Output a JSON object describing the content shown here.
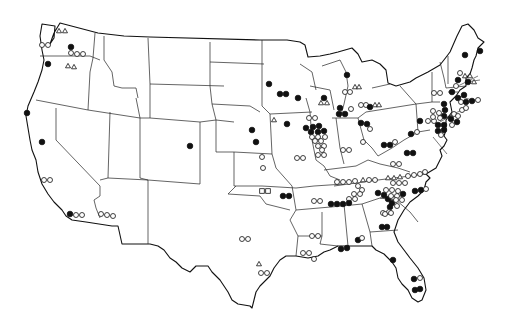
{
  "map": {
    "type": "point-symbol map",
    "region": "Contiguous United States",
    "colors": {
      "background": "#ffffff",
      "ink": "#111111"
    },
    "symbol_types": [
      "filled-circle",
      "open-circle",
      "open-triangle",
      "open-square"
    ],
    "markers": [
      {
        "x": 59,
        "y": 31,
        "t": "tri"
      },
      {
        "x": 65,
        "y": 31,
        "t": "tri"
      },
      {
        "x": 42,
        "y": 45,
        "t": "open"
      },
      {
        "x": 48,
        "y": 45,
        "t": "open"
      },
      {
        "x": 71,
        "y": 47,
        "t": "fill"
      },
      {
        "x": 71,
        "y": 53,
        "t": "open"
      },
      {
        "x": 77,
        "y": 54,
        "t": "open"
      },
      {
        "x": 83,
        "y": 54,
        "t": "open"
      },
      {
        "x": 48,
        "y": 64,
        "t": "fill"
      },
      {
        "x": 68,
        "y": 66,
        "t": "tri"
      },
      {
        "x": 74,
        "y": 67,
        "t": "tri"
      },
      {
        "x": 27,
        "y": 113,
        "t": "fill"
      },
      {
        "x": 42,
        "y": 142,
        "t": "fill"
      },
      {
        "x": 44,
        "y": 180,
        "t": "open"
      },
      {
        "x": 50,
        "y": 180,
        "t": "open"
      },
      {
        "x": 70,
        "y": 214,
        "t": "fill"
      },
      {
        "x": 76,
        "y": 215,
        "t": "open"
      },
      {
        "x": 82,
        "y": 215,
        "t": "open"
      },
      {
        "x": 101,
        "y": 214,
        "t": "open"
      },
      {
        "x": 107,
        "y": 215,
        "t": "open"
      },
      {
        "x": 113,
        "y": 216,
        "t": "open"
      },
      {
        "x": 190,
        "y": 146,
        "t": "fill"
      },
      {
        "x": 252,
        "y": 130,
        "t": "fill"
      },
      {
        "x": 256,
        "y": 142,
        "t": "fill"
      },
      {
        "x": 269,
        "y": 84,
        "t": "fill"
      },
      {
        "x": 280,
        "y": 94,
        "t": "fill"
      },
      {
        "x": 286,
        "y": 94,
        "t": "fill"
      },
      {
        "x": 298,
        "y": 98,
        "t": "fill"
      },
      {
        "x": 274,
        "y": 120,
        "t": "tri"
      },
      {
        "x": 287,
        "y": 124,
        "t": "fill"
      },
      {
        "x": 262,
        "y": 157,
        "t": "open"
      },
      {
        "x": 297,
        "y": 158,
        "t": "open"
      },
      {
        "x": 303,
        "y": 158,
        "t": "open"
      },
      {
        "x": 263,
        "y": 168,
        "t": "open"
      },
      {
        "x": 262,
        "y": 191,
        "t": "sq"
      },
      {
        "x": 268,
        "y": 191,
        "t": "sq"
      },
      {
        "x": 283,
        "y": 196,
        "t": "fill"
      },
      {
        "x": 289,
        "y": 196,
        "t": "fill"
      },
      {
        "x": 324,
        "y": 98,
        "t": "fill"
      },
      {
        "x": 321,
        "y": 103,
        "t": "tri"
      },
      {
        "x": 327,
        "y": 103,
        "t": "tri"
      },
      {
        "x": 319,
        "y": 126,
        "t": "fill"
      },
      {
        "x": 313,
        "y": 127,
        "t": "fill"
      },
      {
        "x": 306,
        "y": 128,
        "t": "fill"
      },
      {
        "x": 311,
        "y": 132,
        "t": "fill"
      },
      {
        "x": 318,
        "y": 132,
        "t": "fill"
      },
      {
        "x": 324,
        "y": 131,
        "t": "fill"
      },
      {
        "x": 312,
        "y": 137,
        "t": "open"
      },
      {
        "x": 318,
        "y": 137,
        "t": "open"
      },
      {
        "x": 325,
        "y": 137,
        "t": "open"
      },
      {
        "x": 315,
        "y": 141,
        "t": "open"
      },
      {
        "x": 321,
        "y": 141,
        "t": "open"
      },
      {
        "x": 318,
        "y": 146,
        "t": "open"
      },
      {
        "x": 324,
        "y": 146,
        "t": "open"
      },
      {
        "x": 322,
        "y": 150,
        "t": "open"
      },
      {
        "x": 318,
        "y": 155,
        "t": "open"
      },
      {
        "x": 324,
        "y": 155,
        "t": "open"
      },
      {
        "x": 309,
        "y": 118,
        "t": "open"
      },
      {
        "x": 315,
        "y": 118,
        "t": "open"
      },
      {
        "x": 347,
        "y": 75,
        "t": "fill"
      },
      {
        "x": 345,
        "y": 92,
        "t": "open"
      },
      {
        "x": 350,
        "y": 92,
        "t": "open"
      },
      {
        "x": 355,
        "y": 87,
        "t": "tri"
      },
      {
        "x": 359,
        "y": 87,
        "t": "tri"
      },
      {
        "x": 340,
        "y": 108,
        "t": "fill"
      },
      {
        "x": 339,
        "y": 114,
        "t": "fill"
      },
      {
        "x": 345,
        "y": 114,
        "t": "fill"
      },
      {
        "x": 351,
        "y": 109,
        "t": "open"
      },
      {
        "x": 361,
        "y": 105,
        "t": "open"
      },
      {
        "x": 366,
        "y": 105,
        "t": "open"
      },
      {
        "x": 370,
        "y": 107,
        "t": "fill"
      },
      {
        "x": 375,
        "y": 105,
        "t": "tri"
      },
      {
        "x": 379,
        "y": 105,
        "t": "tri"
      },
      {
        "x": 343,
        "y": 150,
        "t": "open"
      },
      {
        "x": 349,
        "y": 150,
        "t": "open"
      },
      {
        "x": 363,
        "y": 142,
        "t": "open"
      },
      {
        "x": 361,
        "y": 123,
        "t": "fill"
      },
      {
        "x": 367,
        "y": 124,
        "t": "fill"
      },
      {
        "x": 370,
        "y": 129,
        "t": "open"
      },
      {
        "x": 393,
        "y": 164,
        "t": "open"
      },
      {
        "x": 399,
        "y": 164,
        "t": "open"
      },
      {
        "x": 407,
        "y": 153,
        "t": "fill"
      },
      {
        "x": 413,
        "y": 153,
        "t": "fill"
      },
      {
        "x": 420,
        "y": 121,
        "t": "fill"
      },
      {
        "x": 428,
        "y": 121,
        "t": "open"
      },
      {
        "x": 434,
        "y": 121,
        "t": "open"
      },
      {
        "x": 384,
        "y": 145,
        "t": "fill"
      },
      {
        "x": 390,
        "y": 145,
        "t": "fill"
      },
      {
        "x": 395,
        "y": 142,
        "t": "open"
      },
      {
        "x": 411,
        "y": 134,
        "t": "fill"
      },
      {
        "x": 417,
        "y": 132,
        "t": "open"
      },
      {
        "x": 337,
        "y": 182,
        "t": "open"
      },
      {
        "x": 343,
        "y": 182,
        "t": "open"
      },
      {
        "x": 349,
        "y": 182,
        "t": "open"
      },
      {
        "x": 355,
        "y": 181,
        "t": "open"
      },
      {
        "x": 363,
        "y": 180,
        "t": "tri"
      },
      {
        "x": 369,
        "y": 180,
        "t": "open"
      },
      {
        "x": 375,
        "y": 180,
        "t": "open"
      },
      {
        "x": 388,
        "y": 178,
        "t": "tri"
      },
      {
        "x": 394,
        "y": 178,
        "t": "tri"
      },
      {
        "x": 400,
        "y": 177,
        "t": "tri"
      },
      {
        "x": 393,
        "y": 183,
        "t": "open"
      },
      {
        "x": 399,
        "y": 183,
        "t": "open"
      },
      {
        "x": 405,
        "y": 183,
        "t": "open"
      },
      {
        "x": 408,
        "y": 176,
        "t": "open"
      },
      {
        "x": 414,
        "y": 175,
        "t": "open"
      },
      {
        "x": 420,
        "y": 174,
        "t": "open"
      },
      {
        "x": 425,
        "y": 172,
        "t": "open"
      },
      {
        "x": 358,
        "y": 186,
        "t": "open"
      },
      {
        "x": 362,
        "y": 190,
        "t": "open"
      },
      {
        "x": 354,
        "y": 194,
        "t": "open"
      },
      {
        "x": 360,
        "y": 194,
        "t": "open"
      },
      {
        "x": 349,
        "y": 199,
        "t": "open"
      },
      {
        "x": 355,
        "y": 199,
        "t": "open"
      },
      {
        "x": 378,
        "y": 193,
        "t": "fill"
      },
      {
        "x": 384,
        "y": 195,
        "t": "fill"
      },
      {
        "x": 388,
        "y": 199,
        "t": "fill"
      },
      {
        "x": 392,
        "y": 203,
        "t": "fill"
      },
      {
        "x": 386,
        "y": 190,
        "t": "open"
      },
      {
        "x": 392,
        "y": 190,
        "t": "open"
      },
      {
        "x": 398,
        "y": 191,
        "t": "open"
      },
      {
        "x": 391,
        "y": 196,
        "t": "open"
      },
      {
        "x": 397,
        "y": 196,
        "t": "open"
      },
      {
        "x": 403,
        "y": 194,
        "t": "fill"
      },
      {
        "x": 396,
        "y": 200,
        "t": "open"
      },
      {
        "x": 402,
        "y": 200,
        "t": "open"
      },
      {
        "x": 390,
        "y": 207,
        "t": "fill"
      },
      {
        "x": 397,
        "y": 206,
        "t": "open"
      },
      {
        "x": 383,
        "y": 213,
        "t": "open"
      },
      {
        "x": 389,
        "y": 212,
        "t": "open"
      },
      {
        "x": 415,
        "y": 191,
        "t": "fill"
      },
      {
        "x": 421,
        "y": 190,
        "t": "fill"
      },
      {
        "x": 426,
        "y": 189,
        "t": "open"
      },
      {
        "x": 331,
        "y": 204,
        "t": "fill"
      },
      {
        "x": 337,
        "y": 204,
        "t": "fill"
      },
      {
        "x": 343,
        "y": 204,
        "t": "fill"
      },
      {
        "x": 349,
        "y": 203,
        "t": "fill"
      },
      {
        "x": 314,
        "y": 201,
        "t": "open"
      },
      {
        "x": 320,
        "y": 201,
        "t": "open"
      },
      {
        "x": 312,
        "y": 236,
        "t": "open"
      },
      {
        "x": 318,
        "y": 236,
        "t": "open"
      },
      {
        "x": 303,
        "y": 253,
        "t": "open"
      },
      {
        "x": 309,
        "y": 253,
        "t": "open"
      },
      {
        "x": 314,
        "y": 259,
        "t": "open"
      },
      {
        "x": 341,
        "y": 249,
        "t": "fill"
      },
      {
        "x": 347,
        "y": 248,
        "t": "fill"
      },
      {
        "x": 242,
        "y": 239,
        "t": "open"
      },
      {
        "x": 248,
        "y": 239,
        "t": "open"
      },
      {
        "x": 259,
        "y": 264,
        "t": "tri"
      },
      {
        "x": 261,
        "y": 273,
        "t": "open"
      },
      {
        "x": 267,
        "y": 273,
        "t": "open"
      },
      {
        "x": 358,
        "y": 240,
        "t": "fill"
      },
      {
        "x": 362,
        "y": 238,
        "t": "open"
      },
      {
        "x": 382,
        "y": 227,
        "t": "fill"
      },
      {
        "x": 387,
        "y": 227,
        "t": "fill"
      },
      {
        "x": 385,
        "y": 214,
        "t": "open"
      },
      {
        "x": 391,
        "y": 213,
        "t": "open"
      },
      {
        "x": 393,
        "y": 260,
        "t": "fill"
      },
      {
        "x": 414,
        "y": 279,
        "t": "fill"
      },
      {
        "x": 420,
        "y": 278,
        "t": "open"
      },
      {
        "x": 415,
        "y": 290,
        "t": "fill"
      },
      {
        "x": 420,
        "y": 289,
        "t": "fill"
      },
      {
        "x": 434,
        "y": 93,
        "t": "open"
      },
      {
        "x": 440,
        "y": 93,
        "t": "open"
      },
      {
        "x": 444,
        "y": 104,
        "t": "fill"
      },
      {
        "x": 445,
        "y": 110,
        "t": "fill"
      },
      {
        "x": 444,
        "y": 116,
        "t": "fill"
      },
      {
        "x": 438,
        "y": 125,
        "t": "fill"
      },
      {
        "x": 444,
        "y": 125,
        "t": "fill"
      },
      {
        "x": 438,
        "y": 131,
        "t": "fill"
      },
      {
        "x": 444,
        "y": 130,
        "t": "fill"
      },
      {
        "x": 433,
        "y": 111,
        "t": "open"
      },
      {
        "x": 433,
        "y": 117,
        "t": "open"
      },
      {
        "x": 439,
        "y": 113,
        "t": "open"
      },
      {
        "x": 440,
        "y": 118,
        "t": "open"
      },
      {
        "x": 441,
        "y": 135,
        "t": "open"
      },
      {
        "x": 452,
        "y": 92,
        "t": "fill"
      },
      {
        "x": 458,
        "y": 98,
        "t": "fill"
      },
      {
        "x": 464,
        "y": 95,
        "t": "fill"
      },
      {
        "x": 458,
        "y": 80,
        "t": "fill"
      },
      {
        "x": 465,
        "y": 76,
        "t": "tri"
      },
      {
        "x": 470,
        "y": 76,
        "t": "tri"
      },
      {
        "x": 468,
        "y": 82,
        "t": "fill"
      },
      {
        "x": 474,
        "y": 82,
        "t": "tri"
      },
      {
        "x": 456,
        "y": 86,
        "t": "open"
      },
      {
        "x": 460,
        "y": 73,
        "t": "open"
      },
      {
        "x": 461,
        "y": 102,
        "t": "open"
      },
      {
        "x": 466,
        "y": 102,
        "t": "fill"
      },
      {
        "x": 472,
        "y": 101,
        "t": "fill"
      },
      {
        "x": 478,
        "y": 100,
        "t": "open"
      },
      {
        "x": 462,
        "y": 110,
        "t": "open"
      },
      {
        "x": 466,
        "y": 108,
        "t": "open"
      },
      {
        "x": 454,
        "y": 114,
        "t": "open"
      },
      {
        "x": 458,
        "y": 116,
        "t": "open"
      },
      {
        "x": 451,
        "y": 119,
        "t": "fill"
      },
      {
        "x": 457,
        "y": 122,
        "t": "fill"
      },
      {
        "x": 452,
        "y": 125,
        "t": "open"
      },
      {
        "x": 465,
        "y": 55,
        "t": "fill"
      },
      {
        "x": 480,
        "y": 51,
        "t": "fill"
      }
    ],
    "leader_lines": [
      {
        "x1": 466,
        "y1": 82,
        "x2": 480,
        "y2": 80
      },
      {
        "x1": 458,
        "y1": 86,
        "x2": 478,
        "y2": 76
      },
      {
        "x1": 458,
        "y1": 96,
        "x2": 476,
        "y2": 101
      },
      {
        "x1": 445,
        "y1": 118,
        "x2": 462,
        "y2": 110
      },
      {
        "x1": 440,
        "y1": 122,
        "x2": 454,
        "y2": 114
      },
      {
        "x1": 433,
        "y1": 137,
        "x2": 447,
        "y2": 154
      }
    ]
  }
}
